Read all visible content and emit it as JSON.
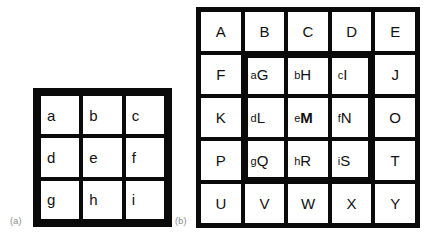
{
  "figure": {
    "panels": [
      {
        "caption": "(a)",
        "type": "grid",
        "rows": 3,
        "cols": 3,
        "cells": [
          {
            "label": "a"
          },
          {
            "label": "b"
          },
          {
            "label": "c"
          },
          {
            "label": "d"
          },
          {
            "label": "e"
          },
          {
            "label": "f"
          },
          {
            "label": "g"
          },
          {
            "label": "h"
          },
          {
            "label": "i"
          }
        ]
      },
      {
        "caption": "(b)",
        "type": "grid",
        "rows": 5,
        "cols": 5,
        "highlight": {
          "description": "thick border around central 3x3 block",
          "row_start": 2,
          "row_end": 4,
          "col_start": 2,
          "col_end": 4
        },
        "cells": [
          {
            "upper": "A",
            "lower": "",
            "inner": false,
            "bold": false
          },
          {
            "upper": "B",
            "lower": "",
            "inner": false,
            "bold": false
          },
          {
            "upper": "C",
            "lower": "",
            "inner": false,
            "bold": false
          },
          {
            "upper": "D",
            "lower": "",
            "inner": false,
            "bold": false
          },
          {
            "upper": "E",
            "lower": "",
            "inner": false,
            "bold": false
          },
          {
            "upper": "F",
            "lower": "",
            "inner": false,
            "bold": false
          },
          {
            "upper": "G",
            "lower": "a",
            "inner": true,
            "bold": false
          },
          {
            "upper": "H",
            "lower": "b",
            "inner": true,
            "bold": false
          },
          {
            "upper": "I",
            "lower": "c",
            "inner": true,
            "bold": false
          },
          {
            "upper": "J",
            "lower": "",
            "inner": false,
            "bold": false
          },
          {
            "upper": "K",
            "lower": "",
            "inner": false,
            "bold": false
          },
          {
            "upper": "L",
            "lower": "d",
            "inner": true,
            "bold": false
          },
          {
            "upper": "M",
            "lower": "e",
            "inner": true,
            "bold": true
          },
          {
            "upper": "N",
            "lower": "f",
            "inner": true,
            "bold": false
          },
          {
            "upper": "O",
            "lower": "",
            "inner": false,
            "bold": false
          },
          {
            "upper": "P",
            "lower": "",
            "inner": false,
            "bold": false
          },
          {
            "upper": "Q",
            "lower": "g",
            "inner": true,
            "bold": false
          },
          {
            "upper": "R",
            "lower": "h",
            "inner": true,
            "bold": false
          },
          {
            "upper": "S",
            "lower": "i",
            "inner": true,
            "bold": false
          },
          {
            "upper": "T",
            "lower": "",
            "inner": false,
            "bold": false
          },
          {
            "upper": "U",
            "lower": "",
            "inner": false,
            "bold": false
          },
          {
            "upper": "V",
            "lower": "",
            "inner": false,
            "bold": false
          },
          {
            "upper": "W",
            "lower": "",
            "inner": false,
            "bold": false
          },
          {
            "upper": "X",
            "lower": "",
            "inner": false,
            "bold": false
          },
          {
            "upper": "Y",
            "lower": "",
            "inner": false,
            "bold": false
          }
        ]
      }
    ]
  },
  "colors": {
    "background": "#ffffff",
    "grid_line": "#0a0a0a",
    "cell_fill": "#ffffff",
    "glyph": "#111111",
    "caption": "#8a8a8a"
  }
}
